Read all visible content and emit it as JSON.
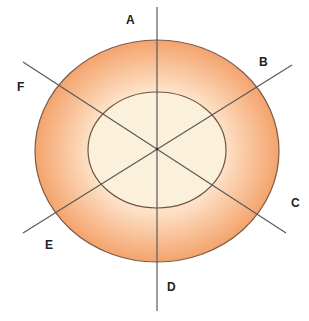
{
  "diagram": {
    "type": "concentric-ellipses-with-radial-lines",
    "labels": {
      "A": "A",
      "B": "B",
      "C": "C",
      "D": "D",
      "E": "E",
      "F": "F"
    },
    "colors": {
      "outer_edge": "#f4a36c",
      "outer_light": "#fcdcbc",
      "inner_fill": "#fbf0da",
      "stroke": "#7a5c4a",
      "line": "#555555"
    }
  }
}
